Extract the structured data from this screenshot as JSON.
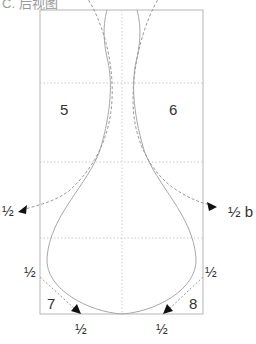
{
  "title": "C. 后视图",
  "regions": [
    {
      "id": "5",
      "label": "5"
    },
    {
      "id": "6",
      "label": "6"
    },
    {
      "id": "7",
      "label": "7"
    },
    {
      "id": "8",
      "label": "8"
    }
  ],
  "annotations": {
    "left_arrow": "½",
    "right_arrow": "½ b",
    "bottom_left_side": "½",
    "bottom_left_base": "½",
    "bottom_right_side": "½",
    "bottom_right_base": "½"
  },
  "colors": {
    "outline": "#aaaaaa",
    "dashed": "#999999",
    "grid": "#cccccc",
    "text": "#333333"
  }
}
